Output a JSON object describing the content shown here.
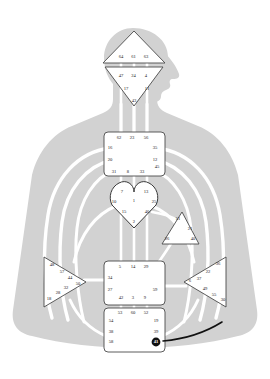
{
  "diagram": {
    "type": "bodygraph",
    "background_color": "#ffffff",
    "body_silhouette_color": "#d2d2d2",
    "channel_color": "#ffffff",
    "center_fill": "#ffffff",
    "center_stroke": "#5a5a5a",
    "gate_text_color": "#1a1a1a",
    "highlight_fill": "#111111",
    "highlight_text_color": "#ffffff",
    "pointer_line_color": "#111111"
  },
  "centers": [
    {
      "id": "head",
      "name": "Head Center",
      "shape": "triangle-up",
      "gates": [
        {
          "num": "64",
          "x": 121,
          "y": 57
        },
        {
          "num": "61",
          "x": 133.5,
          "y": 57
        },
        {
          "num": "63",
          "x": 146,
          "y": 57
        }
      ]
    },
    {
      "id": "ajna",
      "name": "Ajna Center",
      "shape": "triangle-down",
      "gates": [
        {
          "num": "47",
          "x": 121,
          "y": 76
        },
        {
          "num": "24",
          "x": 133.5,
          "y": 76
        },
        {
          "num": "4",
          "x": 146,
          "y": 76
        },
        {
          "num": "17",
          "x": 126,
          "y": 89
        },
        {
          "num": "11",
          "x": 147,
          "y": 89
        },
        {
          "num": "43",
          "x": 134,
          "y": 101
        }
      ]
    },
    {
      "id": "throat",
      "name": "Throat Center",
      "shape": "square",
      "gates": [
        {
          "num": "62",
          "x": 119,
          "y": 138
        },
        {
          "num": "23",
          "x": 132,
          "y": 138
        },
        {
          "num": "56",
          "x": 146,
          "y": 138
        },
        {
          "num": "16",
          "x": 110,
          "y": 148
        },
        {
          "num": "35",
          "x": 155,
          "y": 148
        },
        {
          "num": "20",
          "x": 110,
          "y": 160
        },
        {
          "num": "12",
          "x": 155,
          "y": 160
        },
        {
          "num": "45",
          "x": 157,
          "y": 167
        },
        {
          "num": "31",
          "x": 114,
          "y": 172
        },
        {
          "num": "8",
          "x": 128,
          "y": 172
        },
        {
          "num": "33",
          "x": 142,
          "y": 172
        }
      ]
    },
    {
      "id": "g",
      "name": "G Center (Identity)",
      "shape": "heart",
      "gates": [
        {
          "num": "7",
          "x": 122,
          "y": 192
        },
        {
          "num": "13",
          "x": 146,
          "y": 192
        },
        {
          "num": "10",
          "x": 114,
          "y": 202
        },
        {
          "num": "1",
          "x": 134,
          "y": 201
        },
        {
          "num": "25",
          "x": 154,
          "y": 202
        },
        {
          "num": "15",
          "x": 124,
          "y": 212
        },
        {
          "num": "46",
          "x": 147,
          "y": 212
        },
        {
          "num": "2",
          "x": 134,
          "y": 222
        }
      ]
    },
    {
      "id": "ego",
      "name": "Ego / Heart Center",
      "shape": "triangle-left",
      "gates": [
        {
          "num": "51",
          "x": 178,
          "y": 219
        },
        {
          "num": "21",
          "x": 190,
          "y": 229
        },
        {
          "num": "26",
          "x": 167,
          "y": 239
        },
        {
          "num": "40",
          "x": 193,
          "y": 239
        }
      ]
    },
    {
      "id": "sacral",
      "name": "Sacral Center",
      "shape": "square",
      "gates": [
        {
          "num": "5",
          "x": 120,
          "y": 267
        },
        {
          "num": "14",
          "x": 133,
          "y": 267
        },
        {
          "num": "29",
          "x": 146,
          "y": 267
        },
        {
          "num": "34",
          "x": 110,
          "y": 278
        },
        {
          "num": "27",
          "x": 110,
          "y": 290
        },
        {
          "num": "59",
          "x": 155,
          "y": 290
        },
        {
          "num": "42",
          "x": 121,
          "y": 298
        },
        {
          "num": "3",
          "x": 133,
          "y": 298
        },
        {
          "num": "9",
          "x": 145,
          "y": 298
        }
      ]
    },
    {
      "id": "spleen",
      "name": "Spleen Center",
      "shape": "triangle-right",
      "gates": [
        {
          "num": "48",
          "x": 52,
          "y": 265
        },
        {
          "num": "57",
          "x": 62,
          "y": 272
        },
        {
          "num": "44",
          "x": 70,
          "y": 278
        },
        {
          "num": "50",
          "x": 78,
          "y": 284
        },
        {
          "num": "32",
          "x": 66,
          "y": 288
        },
        {
          "num": "28",
          "x": 58,
          "y": 293
        },
        {
          "num": "18",
          "x": 49,
          "y": 299
        }
      ]
    },
    {
      "id": "solar-plexus",
      "name": "Solar Plexus Center",
      "shape": "triangle-left",
      "gates": [
        {
          "num": "36",
          "x": 218,
          "y": 264
        },
        {
          "num": "22",
          "x": 208,
          "y": 272
        },
        {
          "num": "37",
          "x": 199,
          "y": 279
        },
        {
          "num": "6",
          "x": 190,
          "y": 281
        },
        {
          "num": "49",
          "x": 205,
          "y": 289
        },
        {
          "num": "55",
          "x": 214,
          "y": 295
        },
        {
          "num": "30",
          "x": 223,
          "y": 300
        }
      ]
    },
    {
      "id": "root",
      "name": "Root Center",
      "shape": "square",
      "gates": [
        {
          "num": "53",
          "x": 120,
          "y": 313
        },
        {
          "num": "60",
          "x": 133,
          "y": 313
        },
        {
          "num": "52",
          "x": 146,
          "y": 313
        },
        {
          "num": "54",
          "x": 111,
          "y": 321
        },
        {
          "num": "19",
          "x": 156,
          "y": 321
        },
        {
          "num": "38",
          "x": 111,
          "y": 332
        },
        {
          "num": "39",
          "x": 156,
          "y": 332
        },
        {
          "num": "58",
          "x": 111,
          "y": 342
        },
        {
          "num": "41",
          "x": 156,
          "y": 342,
          "highlight": true
        }
      ]
    }
  ],
  "annotation": {
    "highlighted_gate": "41",
    "pointer": "curved-line-right"
  }
}
